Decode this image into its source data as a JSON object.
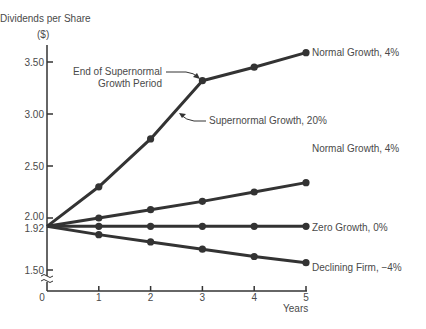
{
  "chart_data": {
    "type": "line",
    "title": "",
    "ylabel": "Dividends per Share",
    "yunit": "($)",
    "xlabel": "Years",
    "x": [
      0,
      1,
      2,
      3,
      4,
      5
    ],
    "x_tick_labels": [
      "0",
      "1",
      "2",
      "3",
      "4",
      "5"
    ],
    "y_ticks": [
      1.5,
      1.92,
      2.0,
      2.5,
      3.0,
      3.5
    ],
    "y_tick_labels": [
      "1.50",
      "1.92",
      "2.00",
      "2.50",
      "3.00",
      "3.50"
    ],
    "ylim": [
      1.5,
      3.6
    ],
    "axis_break": true,
    "grid": false,
    "legend": "inline labels at line ends",
    "series": [
      {
        "name": "Supernormal Growth, 20% then Normal Growth, 4%",
        "values": [
          1.92,
          2.3,
          2.76,
          3.32,
          3.45,
          3.59
        ]
      },
      {
        "name": "Normal Growth, 4%",
        "values": [
          1.92,
          2.0,
          2.08,
          2.16,
          2.25,
          2.34
        ]
      },
      {
        "name": "Zero Growth, 0%",
        "values": [
          1.92,
          1.92,
          1.92,
          1.92,
          1.92,
          1.92
        ]
      },
      {
        "name": "Declining Firm, −4%",
        "values": [
          1.92,
          1.84,
          1.77,
          1.7,
          1.63,
          1.57
        ]
      }
    ],
    "annotations": [
      {
        "text": "End of Supernormal Growth Period",
        "x": 3,
        "y": 3.32
      },
      {
        "text": "Supernormal Growth, 20%",
        "x": 2.5,
        "y": 3.05
      }
    ]
  },
  "labels": {
    "ylabel": "Dividends per Share",
    "yunit": "($)",
    "xlabel": "Years",
    "series_super_end": "Normal Growth, 4%",
    "series_super_mid": "Supernormal Growth, 20%",
    "annot_end_line1": "End of Supernormal",
    "annot_end_line2": "Growth Period",
    "series_normal": "Normal Growth, 4%",
    "series_zero": "Zero Growth, 0%",
    "series_declining": "Declining Firm, −4%"
  },
  "colors": {
    "line": "#333333",
    "text": "#4a4a4a",
    "background": "#ffffff"
  }
}
